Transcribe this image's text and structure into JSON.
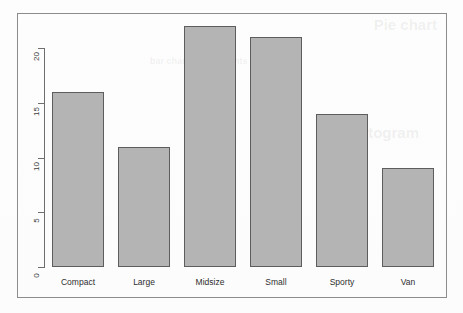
{
  "chart_data": {
    "type": "bar",
    "title": "",
    "subtitle": "",
    "xlabel": "",
    "ylabel": "",
    "categories": [
      "Compact",
      "Large",
      "Midsize",
      "Small",
      "Sporty",
      "Van"
    ],
    "values": [
      16,
      11,
      22,
      21,
      14,
      9
    ],
    "series": [
      {
        "name": "Count",
        "values": [
          16,
          11,
          22,
          21,
          14,
          9
        ]
      }
    ],
    "ylim": [
      0,
      22
    ],
    "y_ticks": [
      0,
      5,
      10,
      15,
      20
    ],
    "y_tick_labels": [
      "0",
      "5",
      "10",
      "15",
      "20"
    ],
    "y_tick_label_rotation": "-90",
    "grid": "off",
    "legend": "none",
    "bar_fill_color": "#b4b4b4",
    "bar_border_color": "#5d5d5d",
    "axis_color": "#6e6e6e",
    "frame_color": "#8c8c8c",
    "background_color": "#fdfdfd"
  },
  "figure": {
    "has_outer_frame": "true",
    "device_background": "#fdfdfd"
  },
  "watermarks": {
    "line_1": "Pie chart",
    "line_2": "Histogram",
    "line_3": "bar chart of the counts"
  }
}
